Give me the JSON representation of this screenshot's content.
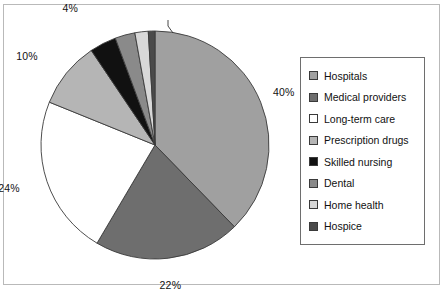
{
  "chart_data": {
    "type": "pie",
    "title": "",
    "subtitle": "",
    "xlabel": "",
    "ylabel": "",
    "legend_position": "right",
    "grid": false,
    "start_angle_deg": 0,
    "direction": "clockwise",
    "categories": [
      "Hospitals",
      "Medical providers",
      "Long-term care",
      "Prescription drugs",
      "Skilled nursing",
      "Dental",
      "Home health",
      "Hospice"
    ],
    "values": [
      40,
      22,
      24,
      10,
      4,
      3,
      2,
      1
    ],
    "value_labels": [
      "40%",
      "22%",
      "24%",
      "10%",
      "4%",
      "3%",
      "2%",
      "1%"
    ],
    "colors": [
      "#a0a0a0",
      "#6e6e6e",
      "#ffffff",
      "#b5b5b5",
      "#111111",
      "#8a8a8a",
      "#d8d8d8",
      "#4a4a4a"
    ],
    "slices": [
      {
        "label": "Hospitals",
        "value": 40,
        "value_label": "40%",
        "color": "#a0a0a0"
      },
      {
        "label": "Medical providers",
        "value": 22,
        "value_label": "22%",
        "color": "#6e6e6e"
      },
      {
        "label": "Long-term care",
        "value": 24,
        "value_label": "24%",
        "color": "#ffffff"
      },
      {
        "label": "Prescription drugs",
        "value": 10,
        "value_label": "10%",
        "color": "#b5b5b5"
      },
      {
        "label": "Skilled nursing",
        "value": 4,
        "value_label": "4%",
        "color": "#111111"
      },
      {
        "label": "Dental",
        "value": 3,
        "value_label": "3%",
        "color": "#8a8a8a"
      },
      {
        "label": "Home health",
        "value": 2,
        "value_label": "2%",
        "color": "#d8d8d8"
      },
      {
        "label": "Hospice",
        "value": 1,
        "value_label": "1%",
        "color": "#4a4a4a"
      }
    ]
  },
  "legend": {
    "items": [
      {
        "label": "Hospitals",
        "color": "#a0a0a0"
      },
      {
        "label": "Medical providers",
        "color": "#6e6e6e"
      },
      {
        "label": "Long-term care",
        "color": "#ffffff"
      },
      {
        "label": "Prescription drugs",
        "color": "#b5b5b5"
      },
      {
        "label": "Skilled nursing",
        "color": "#111111"
      },
      {
        "label": "Dental",
        "color": "#8a8a8a"
      },
      {
        "label": "Home health",
        "color": "#d8d8d8"
      },
      {
        "label": "Hospice",
        "color": "#4a4a4a"
      }
    ]
  }
}
